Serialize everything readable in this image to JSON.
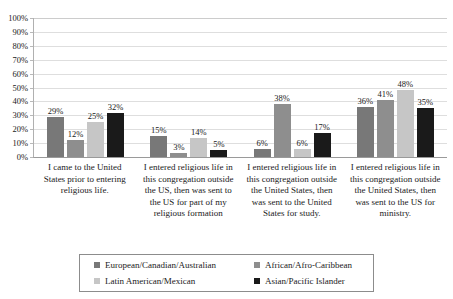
{
  "title_sliver": "",
  "chart_data": {
    "type": "bar",
    "title": "",
    "subtitle": "",
    "xlabel": "",
    "ylabel": "",
    "ylim": [
      0,
      100
    ],
    "grid": true,
    "legend_position": "bottom",
    "value_suffix": "%",
    "y_ticks": [
      "100%",
      "90%",
      "80%",
      "70%",
      "60%",
      "50%",
      "40%",
      "30%",
      "20%",
      "10%",
      "0%"
    ],
    "y_tick_values": [
      100,
      90,
      80,
      70,
      60,
      50,
      40,
      30,
      20,
      10,
      0
    ],
    "categories": [
      "I came to the United States prior to entering religious life.",
      "I entered religious life in this congregation outside the US, then was sent to the US for part of my religious formation",
      "I entered religious life in this congregation outside the United States, then was sent to the United States for study.",
      "I entered religious life in this congregation outside the United States, then was sent to the US for ministry."
    ],
    "series": [
      {
        "name": "European/Canadian/Australian",
        "color": "#787878",
        "values": [
          29,
          15,
          6,
          36
        ],
        "labels": [
          "29%",
          "15%",
          "6%",
          "36%"
        ]
      },
      {
        "name": "African/Afro-Caribbean",
        "color": "#8e8e8e",
        "values": [
          12,
          3,
          38,
          41
        ],
        "labels": [
          "12%",
          "3%",
          "38%",
          "41%"
        ]
      },
      {
        "name": "Latin American/Mexican",
        "color": "#c6c6c6",
        "values": [
          25,
          14,
          6,
          48
        ],
        "labels": [
          "25%",
          "14%",
          "6%",
          "48%"
        ]
      },
      {
        "name": "Asian/Pacific Islander",
        "color": "#1a1a1a",
        "values": [
          32,
          5,
          17,
          35
        ],
        "labels": [
          "32%",
          "5%",
          "17%",
          "35%"
        ]
      }
    ]
  }
}
